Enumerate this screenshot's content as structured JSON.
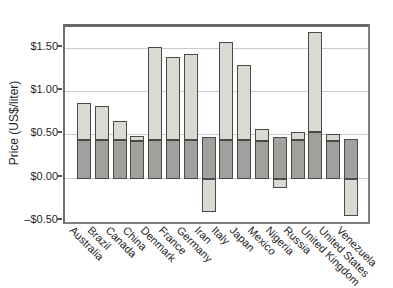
{
  "chart_data": {
    "type": "bar",
    "stacked": true,
    "title": "",
    "xlabel": "",
    "ylabel": "Price (US$/liter)",
    "categories": [
      "Australia",
      "Brazil",
      "Canada",
      "China",
      "Denmark",
      "France",
      "Germany",
      "Iran",
      "Italy",
      "Japan",
      "Mexico",
      "Nigeria",
      "Russia",
      "United Kingdom",
      "United States",
      "Venezuela"
    ],
    "series": [
      {
        "name": "price excluding tax",
        "color": "#a0a09c",
        "values": [
          0.45,
          0.45,
          0.45,
          0.44,
          0.45,
          0.45,
          0.45,
          0.48,
          0.45,
          0.45,
          0.44,
          0.48,
          0.45,
          0.54,
          0.43,
          0.46
        ]
      },
      {
        "name": "tax (negative = subsidy)",
        "color": "#d9dbd2",
        "values": [
          0.42,
          0.39,
          0.22,
          0.05,
          1.07,
          0.95,
          0.99,
          -0.39,
          1.13,
          0.86,
          0.13,
          -0.11,
          0.09,
          1.15,
          0.09,
          -0.43
        ]
      }
    ],
    "totals": [
      0.87,
      0.84,
      0.67,
      0.49,
      1.52,
      1.4,
      1.44,
      0.09,
      1.58,
      1.31,
      0.57,
      0.37,
      0.54,
      1.69,
      0.52,
      0.03
    ],
    "ylim": [
      -0.5,
      1.75
    ],
    "yticks": [
      {
        "label": "$1.50",
        "value": 1.5
      },
      {
        "label": "$1.00",
        "value": 1.0
      },
      {
        "label": "$0.50",
        "value": 0.5
      },
      {
        "label": "$0.00",
        "value": 0.0
      },
      {
        "label": "–$0.50",
        "value": -0.5
      }
    ],
    "gridlines": [
      1.5,
      1.0,
      0.5,
      0.0
    ],
    "grid": true,
    "legend": "none"
  },
  "style": {
    "bar_border": "#4a4a4a",
    "grid_color": "#cbcbcb",
    "axis_color": "#7e7e7e",
    "background": "#ffffff"
  }
}
